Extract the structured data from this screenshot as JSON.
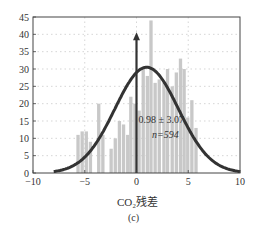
{
  "chart_data": {
    "type": "bar",
    "title": "",
    "xlabel": "CO₂残差",
    "ylabel": "",
    "caption": "(c)",
    "xlim": [
      -10,
      10
    ],
    "ylim": [
      0,
      45
    ],
    "xticks": [
      -10,
      -5,
      0,
      5,
      10
    ],
    "yticks": [
      0,
      5,
      10,
      15,
      20,
      25,
      30,
      35,
      40,
      45
    ],
    "grid": true,
    "bin_width": 0.4,
    "bins": [
      {
        "x": -5.65,
        "count": 11
      },
      {
        "x": -5.25,
        "count": 12
      },
      {
        "x": -4.85,
        "count": 12
      },
      {
        "x": -4.45,
        "count": 9
      },
      {
        "x": -3.65,
        "count": 20
      },
      {
        "x": -3.25,
        "count": 11
      },
      {
        "x": -2.45,
        "count": 7
      },
      {
        "x": -2.05,
        "count": 10
      },
      {
        "x": -1.65,
        "count": 15
      },
      {
        "x": -1.25,
        "count": 14
      },
      {
        "x": -0.85,
        "count": 11
      },
      {
        "x": -0.55,
        "count": 22
      },
      {
        "x": -0.15,
        "count": 20
      },
      {
        "x": 0.25,
        "count": 18
      },
      {
        "x": 0.65,
        "count": 30
      },
      {
        "x": 1.05,
        "count": 28
      },
      {
        "x": 1.4,
        "count": 44
      },
      {
        "x": 1.8,
        "count": 26
      },
      {
        "x": 2.2,
        "count": 27
      },
      {
        "x": 2.65,
        "count": 26
      },
      {
        "x": 3.0,
        "count": 30
      },
      {
        "x": 3.45,
        "count": 25
      },
      {
        "x": 3.85,
        "count": 29
      },
      {
        "x": 4.25,
        "count": 33
      },
      {
        "x": 4.6,
        "count": 30
      },
      {
        "x": 4.95,
        "count": 16
      },
      {
        "x": 5.35,
        "count": 21
      },
      {
        "x": 5.75,
        "count": 13
      }
    ],
    "series": [
      {
        "name": "normal-fit",
        "type": "line",
        "mean": 0.98,
        "sd": 3.07,
        "peak": 30.5,
        "x_range": [
          -8,
          10
        ]
      }
    ],
    "annotations": [
      {
        "text": "0.98 ± 3.07",
        "x": 0.2,
        "y": 14.5
      },
      {
        "text": "n=594",
        "x": 1.5,
        "y": 10
      },
      {
        "type": "arrow",
        "x": 0,
        "from": 0,
        "to": 40
      }
    ],
    "colors": {
      "bars": "#c8c8c8",
      "curve": "#333333",
      "grid": "#bbbbbb",
      "axis": "#444444"
    }
  }
}
